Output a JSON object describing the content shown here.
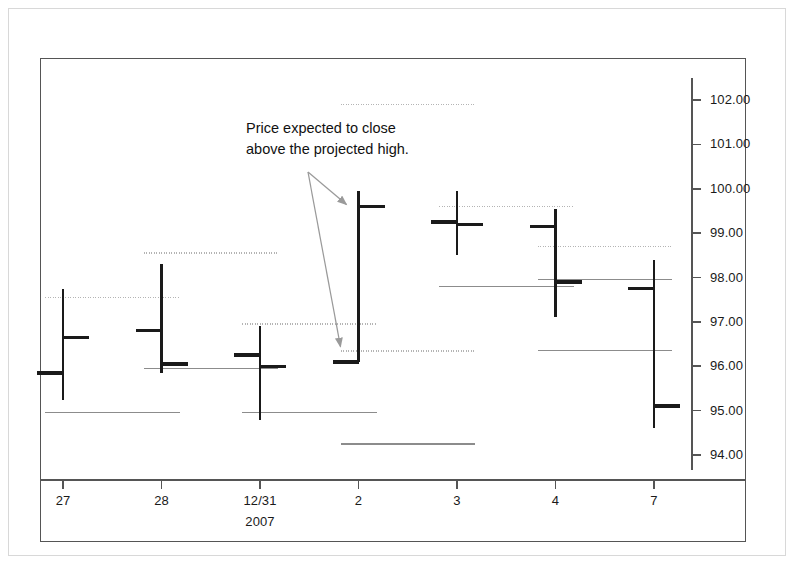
{
  "chart_data": {
    "type": "ohlc",
    "title": "",
    "xlabel": "",
    "ylabel": "",
    "ylim": [
      93.5,
      102.6
    ],
    "ytick_values": [
      102.0,
      101.0,
      100.0,
      99.0,
      98.0,
      97.0,
      96.0,
      95.0,
      94.0
    ],
    "ytick_labels": [
      "102.00",
      "101.00",
      "100.00",
      "99.00",
      "98.00",
      "97.00",
      "96.00",
      "95.00",
      "94.00"
    ],
    "xtick_labels": [
      "27",
      "28",
      "12/31",
      "2",
      "3",
      "4",
      "7"
    ],
    "x_sublabel": "2007",
    "x_sublabel_index": 2,
    "grid": false,
    "legend": null,
    "bars": [
      {
        "label": "27",
        "high": 97.75,
        "low": 95.25,
        "open": 95.85,
        "close": 96.65
      },
      {
        "label": "28",
        "high": 98.3,
        "low": 95.85,
        "open": 96.8,
        "close": 96.05
      },
      {
        "label": "12/31",
        "high": 96.9,
        "low": 94.8,
        "open": 96.25,
        "close": 96.0
      },
      {
        "label": "2",
        "high": 99.95,
        "low": 96.1,
        "open": 96.1,
        "close": 99.6
      },
      {
        "label": "3",
        "high": 99.95,
        "low": 98.5,
        "open": 99.25,
        "close": 99.2
      },
      {
        "label": "4",
        "high": 99.55,
        "low": 97.1,
        "open": 99.15,
        "close": 97.9
      },
      {
        "label": "7",
        "high": 98.4,
        "low": 94.6,
        "open": 97.75,
        "close": 95.1
      }
    ],
    "projection_lines": [
      {
        "value": 97.55,
        "style": "dotted",
        "from_bar": 0,
        "to_bar": 1
      },
      {
        "value": 94.95,
        "style": "solid",
        "from_bar": 0,
        "to_bar": 1
      },
      {
        "value": 98.55,
        "style": "dotted",
        "from_bar": 1,
        "to_bar": 2
      },
      {
        "value": 95.95,
        "style": "solid",
        "from_bar": 1,
        "to_bar": 2
      },
      {
        "value": 96.95,
        "style": "dotted",
        "from_bar": 2,
        "to_bar": 3
      },
      {
        "value": 94.95,
        "style": "solid",
        "from_bar": 2,
        "to_bar": 3
      },
      {
        "value": 101.9,
        "style": "dotted",
        "from_bar": 3,
        "to_bar": 4
      },
      {
        "value": 96.35,
        "style": "dotted",
        "from_bar": 3,
        "to_bar": 4
      },
      {
        "value": 94.25,
        "style": "solid",
        "from_bar": 3,
        "to_bar": 4
      },
      {
        "value": 99.6,
        "style": "dotted",
        "from_bar": 4,
        "to_bar": 5
      },
      {
        "value": 97.8,
        "style": "solid",
        "from_bar": 4,
        "to_bar": 5
      },
      {
        "value": 98.7,
        "style": "dotted",
        "from_bar": 5,
        "to_bar": 6
      },
      {
        "value": 97.95,
        "style": "solid",
        "from_bar": 5,
        "to_bar": 6
      },
      {
        "value": 96.35,
        "style": "solid",
        "from_bar": 5,
        "to_bar": 6
      }
    ],
    "annotation": {
      "line1": "Price expected to close",
      "line2": "above the projected high.",
      "arrows": [
        {
          "target_bar": 3,
          "target_value": 99.6
        },
        {
          "target_bar": 3,
          "target_value": 96.35
        }
      ]
    },
    "colors": {
      "bar": "#1a1a1a",
      "projection_dotted": "#b4b4b4",
      "projection_solid": "#8c8c8c",
      "axis": "#555555",
      "arrow": "#9a9a9a",
      "text": "#111111",
      "background": "#ffffff",
      "outer_frame": "#d8d8d8"
    }
  }
}
